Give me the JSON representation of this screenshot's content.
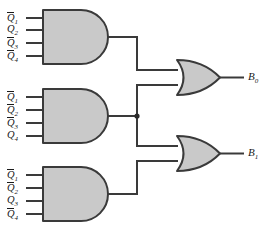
{
  "diagram": {
    "colors": {
      "gate_fill": "#c9c9c9",
      "line": "#3a3a3a",
      "text": "#1a1a1a",
      "background": "#ffffff"
    }
  },
  "and_gates": [
    {
      "id": "and-gate-1",
      "inputs": [
        {
          "base": "Q",
          "subscript": "1",
          "overbar": true,
          "text": "Q1"
        },
        {
          "base": "Q",
          "subscript": "2",
          "overbar": false,
          "text": "Q2"
        },
        {
          "base": "Q",
          "subscript": "3",
          "overbar": true,
          "text": "Q3"
        },
        {
          "base": "Q",
          "subscript": "4",
          "overbar": true,
          "text": "Q4"
        }
      ]
    },
    {
      "id": "and-gate-2",
      "inputs": [
        {
          "base": "Q",
          "subscript": "1",
          "overbar": true,
          "text": "Q1"
        },
        {
          "base": "Q",
          "subscript": "2",
          "overbar": true,
          "text": "Q2"
        },
        {
          "base": "Q",
          "subscript": "3",
          "overbar": true,
          "text": "Q3"
        },
        {
          "base": "Q",
          "subscript": "4",
          "overbar": false,
          "text": "Q4"
        }
      ]
    },
    {
      "id": "and-gate-3",
      "inputs": [
        {
          "base": "Q",
          "subscript": "1",
          "overbar": true,
          "text": "Q1"
        },
        {
          "base": "Q",
          "subscript": "2",
          "overbar": true,
          "text": "Q2"
        },
        {
          "base": "Q",
          "subscript": "3",
          "overbar": false,
          "text": "Q3"
        },
        {
          "base": "Q",
          "subscript": "4",
          "overbar": true,
          "text": "Q4"
        }
      ]
    }
  ],
  "or_gates": [
    {
      "id": "or-gate-0",
      "output": {
        "base": "B",
        "subscript": "0",
        "text": "B0"
      }
    },
    {
      "id": "or-gate-1",
      "output": {
        "base": "B",
        "subscript": "1",
        "text": "B1"
      }
    }
  ]
}
